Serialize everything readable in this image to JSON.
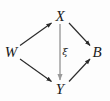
{
  "figure": {
    "kind": "commutative-diagram",
    "background_color": "#fdfdfd",
    "edge_color": "#2b2b2b",
    "vertical_edge_color": "#9a9a9a",
    "label_color": "#1a1a1a"
  },
  "nodes": [
    {
      "id": "X",
      "label": "X",
      "x": 60,
      "y": 16
    },
    {
      "id": "W",
      "label": "W",
      "x": 11,
      "y": 52
    },
    {
      "id": "B",
      "label": "B",
      "x": 97,
      "y": 52
    },
    {
      "id": "Y",
      "label": "Y",
      "x": 60,
      "y": 89
    }
  ],
  "edges": [
    {
      "id": "w-to-x",
      "from": "W",
      "to": "X",
      "label": "",
      "style": "solid",
      "color": "#2b2b2b"
    },
    {
      "id": "x-to-b",
      "from": "X",
      "to": "B",
      "label": "",
      "style": "solid",
      "color": "#2b2b2b"
    },
    {
      "id": "w-to-y",
      "from": "W",
      "to": "Y",
      "label": "",
      "style": "solid",
      "color": "#2b2b2b"
    },
    {
      "id": "y-to-b",
      "from": "Y",
      "to": "B",
      "label": "",
      "style": "solid",
      "color": "#2b2b2b"
    },
    {
      "id": "x-to-y",
      "from": "X",
      "to": "Y",
      "label": "ξ",
      "style": "solid",
      "color": "#9a9a9a"
    }
  ],
  "labels": {
    "node_X": "X",
    "node_W": "W",
    "node_B": "B",
    "node_Y": "Y",
    "edge_xi": "ξ"
  }
}
